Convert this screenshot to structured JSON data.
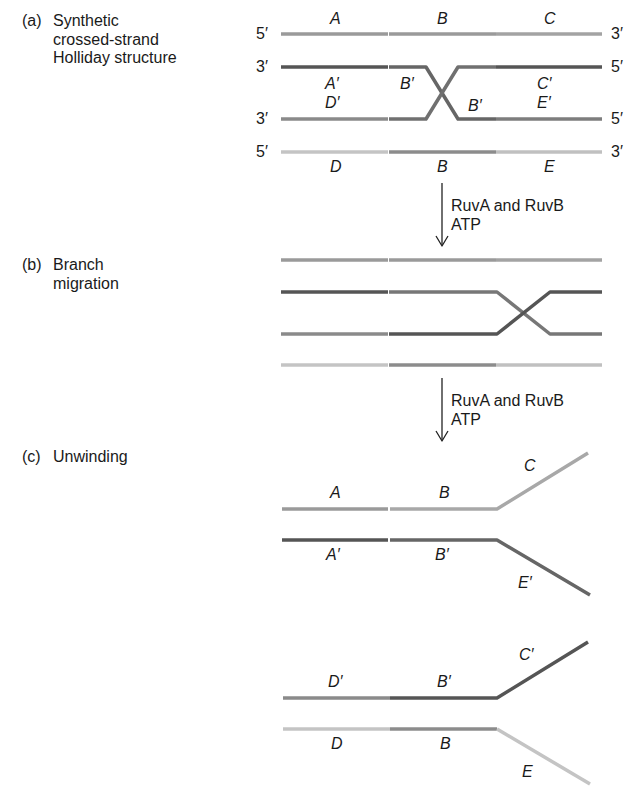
{
  "panels": {
    "a": {
      "tag": "(a)",
      "line1": "Synthetic",
      "line2": "crossed-strand",
      "line3": "Holliday structure"
    },
    "b": {
      "tag": "(b)",
      "line1": "Branch",
      "line2": "migration"
    },
    "c": {
      "tag": "(c)",
      "line1": "Unwinding"
    }
  },
  "ends": {
    "five": "5′",
    "three": "3′"
  },
  "segments": {
    "A": "A",
    "B": "B",
    "C": "C",
    "D": "D",
    "E": "E",
    "A_prime": "A′",
    "B_prime": "B′",
    "C_prime": "C′",
    "D_prime": "D′",
    "E_prime": "E′"
  },
  "steps": [
    {
      "line1": "RuvA and RuvB",
      "line2": "ATP"
    },
    {
      "line1": "RuvA and RuvB",
      "line2": "ATP"
    }
  ],
  "colors": {
    "strand_top": "#9a9a9a",
    "strand_dark": "#555555",
    "strand_mid": "#7d7d7d",
    "strand_light": "#bdbdbd",
    "strand_b_mid": "#888888"
  }
}
